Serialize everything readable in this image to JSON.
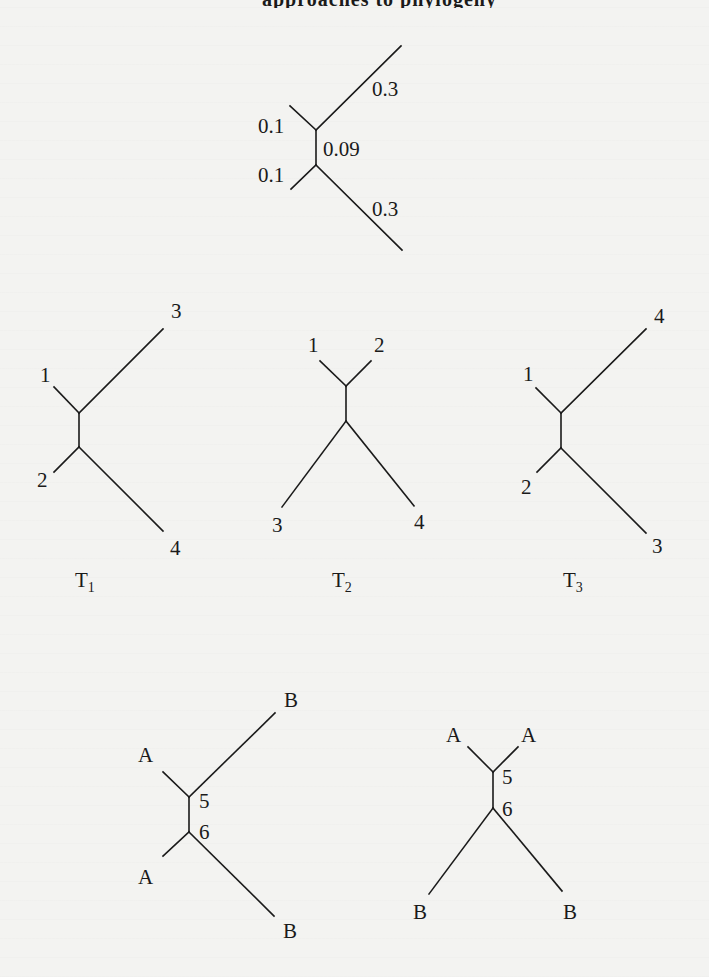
{
  "figure": {
    "type": "phylogenetic-tree-diagram",
    "header_fragment": "approaches to phylogeny",
    "colors": {
      "ink": "#1a1a1a",
      "paper": "#f3f3f1"
    },
    "weighted_tree": {
      "name": "weighted unrooted tree",
      "internal_edge_label": "0.09",
      "branch_labels": {
        "upper_left": "0.1",
        "lower_left": "0.1",
        "upper_right": "0.3",
        "lower_right": "0.3"
      },
      "geometry": {
        "node_top": [
          316,
          130
        ],
        "node_bottom": [
          316,
          165
        ],
        "upper_left_tip": [
          290,
          106
        ],
        "upper_right_tip": [
          401,
          46
        ],
        "lower_left_tip": [
          291,
          189
        ],
        "lower_right_tip": [
          402,
          250
        ]
      },
      "label_pos": {
        "upper_left": [
          258,
          133
        ],
        "lower_left": [
          258,
          182
        ],
        "upper_right": [
          372,
          96
        ],
        "lower_right": [
          372,
          216
        ],
        "internal": [
          323,
          156
        ]
      }
    },
    "topologies": [
      {
        "id": "T1",
        "name": "T",
        "subscript": "1",
        "leaves": {
          "upper_left": "1",
          "lower_left": "2",
          "upper_right": "3",
          "lower_right": "4"
        },
        "geometry": {
          "node_top": [
            79,
            413
          ],
          "node_bottom": [
            79,
            447
          ],
          "upper_left_tip": [
            54,
            387
          ],
          "upper_right_tip": [
            163,
            329
          ],
          "lower_left_tip": [
            54,
            472
          ],
          "lower_right_tip": [
            163,
            531
          ]
        },
        "label_pos": {
          "upper_left": [
            40,
            382
          ],
          "lower_left": [
            37,
            487
          ],
          "upper_right": [
            171,
            318
          ],
          "lower_right": [
            170,
            555
          ],
          "title": [
            75,
            587
          ]
        }
      },
      {
        "id": "T2",
        "name": "T",
        "subscript": "2",
        "leaves": {
          "upper_left": "1",
          "upper_right": "2",
          "lower_left": "3",
          "lower_right": "4"
        },
        "geometry": {
          "node_top": [
            346,
            386
          ],
          "node_bottom": [
            346,
            421
          ],
          "upper_left_tip": [
            320,
            361
          ],
          "upper_right_tip": [
            371,
            361
          ],
          "lower_left_tip": [
            282,
            507
          ],
          "lower_right_tip": [
            414,
            506
          ]
        },
        "label_pos": {
          "upper_left": [
            308,
            352
          ],
          "upper_right": [
            374,
            352
          ],
          "lower_left": [
            272,
            532
          ],
          "lower_right": [
            414,
            529
          ],
          "title": [
            332,
            587
          ]
        }
      },
      {
        "id": "T3",
        "name": "T",
        "subscript": "3",
        "leaves": {
          "upper_left": "1",
          "lower_left": "2",
          "upper_right": "4",
          "lower_right": "3"
        },
        "geometry": {
          "node_top": [
            561,
            413
          ],
          "node_bottom": [
            561,
            448
          ],
          "upper_left_tip": [
            536,
            388
          ],
          "upper_right_tip": [
            646,
            329
          ],
          "lower_left_tip": [
            537,
            472
          ],
          "lower_right_tip": [
            646,
            533
          ]
        },
        "label_pos": {
          "upper_left": [
            523,
            381
          ],
          "lower_left": [
            521,
            494
          ],
          "upper_right": [
            654,
            323
          ],
          "lower_right": [
            652,
            553
          ],
          "title": [
            563,
            587
          ]
        }
      }
    ],
    "labeled_trees": [
      {
        "id": "tree-left",
        "leaves": {
          "upper_left": "A",
          "lower_left": "A",
          "upper_right": "B",
          "lower_right": "B"
        },
        "internal_nodes": {
          "top": "5",
          "bottom": "6"
        },
        "geometry": {
          "node_top": [
            189,
            797
          ],
          "node_bottom": [
            189,
            832
          ],
          "upper_left_tip": [
            163,
            772
          ],
          "upper_right_tip": [
            275,
            713
          ],
          "lower_left_tip": [
            163,
            856
          ],
          "lower_right_tip": [
            274,
            916
          ]
        },
        "label_pos": {
          "upper_left": [
            138,
            762
          ],
          "lower_left": [
            138,
            884
          ],
          "upper_right": [
            284,
            707
          ],
          "lower_right": [
            283,
            938
          ],
          "node_top": [
            199,
            808
          ],
          "node_bottom": [
            199,
            839
          ]
        }
      },
      {
        "id": "tree-right",
        "leaves": {
          "upper_left": "A",
          "upper_right": "A",
          "lower_left": "B",
          "lower_right": "B"
        },
        "internal_nodes": {
          "top": "5",
          "bottom": "6"
        },
        "geometry": {
          "node_top": [
            493,
            772
          ],
          "node_bottom": [
            493,
            808
          ],
          "upper_left_tip": [
            468,
            747
          ],
          "upper_right_tip": [
            518,
            747
          ],
          "lower_left_tip": [
            429,
            894
          ],
          "lower_right_tip": [
            562,
            891
          ]
        },
        "label_pos": {
          "upper_left": [
            446,
            742
          ],
          "upper_right": [
            521,
            742
          ],
          "lower_left": [
            413,
            919
          ],
          "lower_right": [
            563,
            919
          ],
          "node_top": [
            502,
            784
          ],
          "node_bottom": [
            502,
            816
          ]
        }
      }
    ]
  }
}
